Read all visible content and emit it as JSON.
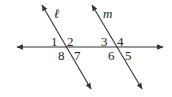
{
  "diagram": {
    "type": "parallel lines cut by a transversal",
    "line_color": "#333333",
    "lines": [
      {
        "name": "l",
        "label": "ℓ"
      },
      {
        "name": "m",
        "label": "m"
      },
      {
        "name": "transversal",
        "label": ""
      }
    ],
    "angles": {
      "a1": "1",
      "a2": "2",
      "a3": "3",
      "a4": "4",
      "a5": "5",
      "a6": "6",
      "a7": "7",
      "a8": "8"
    }
  }
}
